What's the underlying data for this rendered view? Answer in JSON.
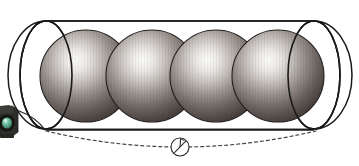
{
  "figure": {
    "alt_text": "Technical illustration: four identical shaded gray spheres arranged in a row inside an open-ended transparent cylinder, with a dashed measurement arc and a circular section marker below.",
    "background_color": "#ffffff",
    "canvas": {
      "width": 359,
      "height": 166
    }
  },
  "cylinder": {
    "name": "transparent cylinder",
    "outline_color": "#1a1a1a",
    "fill_color": "#ffffff",
    "stroke_width": 1.6,
    "left_cap": {
      "cx": 46,
      "cy": 75,
      "rx": 26,
      "ry": 54
    },
    "right_cap": {
      "cx": 314,
      "cy": 75,
      "rx": 26,
      "ry": 54
    },
    "top_line": {
      "x1": 46,
      "y1": 21,
      "x2": 314,
      "y2": 21
    },
    "bottom_line": {
      "x1": 46,
      "y1": 129,
      "x2": 314,
      "y2": 129
    }
  },
  "spheres": {
    "count": 4,
    "radius": 46,
    "center_y": 76,
    "highlight_color": "#f7f7f5",
    "midtone_color": "#8d8781",
    "edge_color": "#3a3330",
    "outline_color": "#231f1d",
    "items": [
      {
        "label": "sphere-1",
        "cx": 86,
        "cy": 76,
        "r": 46,
        "highlight_x": 102,
        "highlight_y": 58
      },
      {
        "label": "sphere-2",
        "cx": 152,
        "cy": 76,
        "r": 46,
        "highlight_x": 166,
        "highlight_y": 58
      },
      {
        "label": "sphere-3",
        "cx": 216,
        "cy": 76,
        "r": 46,
        "highlight_x": 230,
        "highlight_y": 58
      },
      {
        "label": "sphere-4",
        "cx": 278,
        "cy": 76,
        "r": 46,
        "highlight_x": 292,
        "highlight_y": 58
      }
    ]
  },
  "dimension_arc": {
    "name": "dashed measurement arc",
    "color": "#4a4542",
    "dash_pattern": "3 3",
    "stroke_width": 1.2,
    "start": {
      "x": 46,
      "y": 131
    },
    "control": {
      "x": 180,
      "y": 163
    },
    "end": {
      "x": 316,
      "y": 131
    }
  },
  "section_marker": {
    "name": "circular section marker",
    "cx": 180,
    "cy": 147,
    "r": 9,
    "outline_color": "#2b2b2b",
    "fill_color": "#ffffff",
    "slash": {
      "x1": 174,
      "y1": 153,
      "x2": 186,
      "y2": 141
    },
    "flag": {
      "x1": 180,
      "y1": 147,
      "x2": 181,
      "y2": 139
    }
  },
  "corner_object": {
    "name": "cropped camera lens object",
    "body_color": "#2e2f2c",
    "lens_color": "#54b396",
    "lens_highlight": "#b8e4d2",
    "rim_color": "#1b1c1a",
    "x": 0,
    "y": 106,
    "width": 20,
    "height": 32
  },
  "leader_line": {
    "name": "curved leader line",
    "color": "#2a2a2a",
    "stroke_width": 1.3,
    "start": {
      "x": 19,
      "y": 112
    },
    "control": {
      "x": 34,
      "y": 119
    },
    "end": {
      "x": 44,
      "y": 130
    }
  }
}
